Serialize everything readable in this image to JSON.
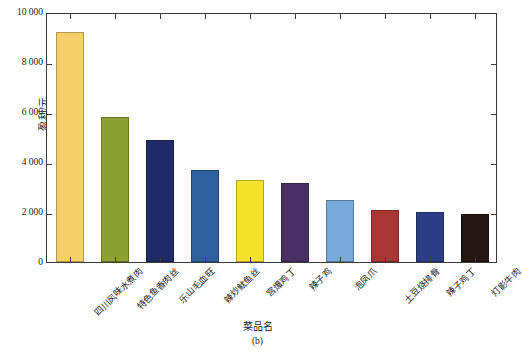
{
  "chart_data": {
    "type": "bar",
    "title": "",
    "subtitle": "",
    "caption": "(b)",
    "xlabel": "菜品名",
    "ylabel": "盈利/元",
    "ylim": [
      0,
      10000
    ],
    "ytick_labels": [
      "10 000",
      "8 000",
      "6 000",
      "4 000",
      "2 000",
      "0"
    ],
    "ytick_values": [
      10000,
      8000,
      6000,
      4000,
      2000,
      0
    ],
    "grid": false,
    "legend": "none",
    "categories": [
      "四川风味水煮肉",
      "特色鱼香肉丝",
      "乐山毛血旺",
      "辣炒鱿鱼丝",
      "宫爆鸡丁",
      "辣子鸡",
      "泡凤爪",
      "土豆烧排骨",
      "辣子鸡丁",
      "灯影牛肉"
    ],
    "values": [
      9200,
      5800,
      4900,
      3700,
      3300,
      3150,
      2500,
      2100,
      2020,
      1920
    ],
    "colors": [
      "#f5d06a",
      "#8ca033",
      "#1f2a66",
      "#2f5f9e",
      "#f5e22a",
      "#4b3065",
      "#79a9dd",
      "#a93634",
      "#2c3f86",
      "#241713"
    ]
  }
}
